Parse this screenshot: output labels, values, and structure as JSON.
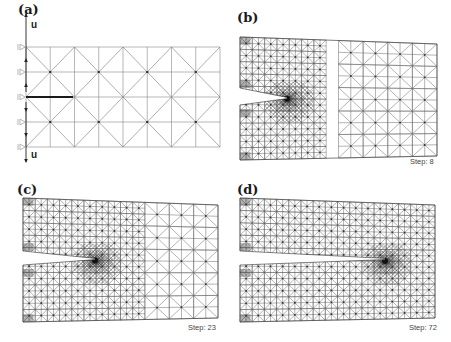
{
  "figure": {
    "panels": [
      {
        "id": "a",
        "label": "(a)",
        "label_pos": [
          18,
          3
        ],
        "type": "initial",
        "step_label": null,
        "mesh": {
          "x0": 26,
          "x1": 220,
          "y_top_left": 47,
          "y_top_right": 47,
          "y_bot_left": 147,
          "y_bot_right": 147,
          "cols": 8,
          "rows": 4
        },
        "crack": {
          "x_start": 26,
          "x_tip": 73,
          "y": 97,
          "opening": 0,
          "thick": true
        },
        "boundary": {
          "supports_y": [
            47,
            72,
            97,
            122,
            147
          ],
          "load_label_top": "u",
          "load_label_bottom": "u"
        }
      },
      {
        "id": "b",
        "label": "(b)",
        "label_pos": [
          237,
          11
        ],
        "type": "adapted",
        "step_label": "Step: 8",
        "step_pos": [
          410,
          158
        ],
        "mesh": {
          "x0": 240,
          "x1": 437,
          "y_top_left": 37,
          "y_top_right": 44,
          "y_bot_left": 160,
          "y_bot_right": 156,
          "cols": 8,
          "rows": 5
        },
        "crack": {
          "x_start": 240,
          "x_tip": 287,
          "y": 98,
          "opening": 17
        },
        "refine_zone_x": 330
      },
      {
        "id": "c",
        "label": "(c)",
        "label_pos": [
          17,
          183
        ],
        "type": "adapted",
        "step_label": "Step: 23",
        "step_pos": [
          188,
          324
        ],
        "mesh": {
          "x0": 23,
          "x1": 218,
          "y_top_left": 198,
          "y_top_right": 205,
          "y_bot_left": 322,
          "y_bot_right": 318,
          "cols": 8,
          "rows": 5
        },
        "crack": {
          "x_start": 23,
          "x_tip": 95,
          "y": 259,
          "opening": 14
        },
        "refine_zone_x": 145
      },
      {
        "id": "d",
        "label": "(d)",
        "label_pos": [
          237,
          183
        ],
        "type": "adapted",
        "step_label": "Step: 72",
        "step_pos": [
          409,
          324
        ],
        "mesh": {
          "x0": 240,
          "x1": 435,
          "y_top_left": 198,
          "y_top_right": 205,
          "y_bot_left": 322,
          "y_bot_right": 318,
          "cols": 8,
          "rows": 5
        },
        "crack": {
          "x_start": 240,
          "x_tip": 385,
          "y": 259,
          "opening": 14
        },
        "refine_zone_x": 435
      }
    ],
    "colors": {
      "mesh_line": "#6a6a6a",
      "mesh_dense": "#222222",
      "node": "#333333",
      "crack": "#1a1a1a",
      "support": "#999999",
      "background": "#ffffff"
    }
  }
}
